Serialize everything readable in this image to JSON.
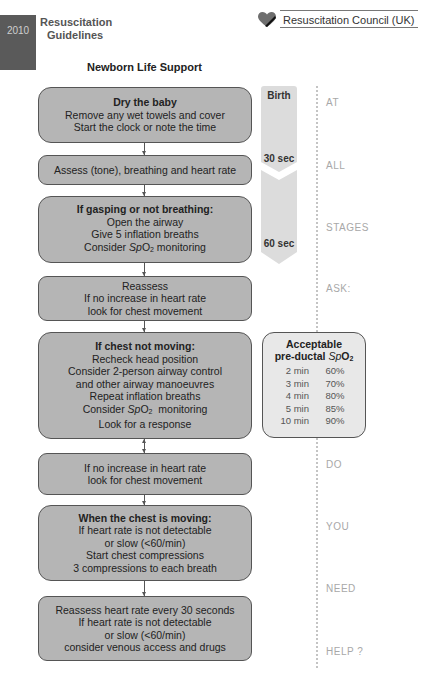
{
  "header": {
    "year": "2010",
    "guidelines_line1": "Resuscitation",
    "guidelines_line2": "Guidelines",
    "organization": "Resuscitation Council (UK)",
    "page_title": "Newborn Life Support"
  },
  "flow": [
    {
      "heading": "Dry the baby",
      "lines": [
        "Remove any wet towels and cover",
        "Start the clock or note the time"
      ]
    },
    {
      "heading": "",
      "lines": [
        "Assess (tone), breathing and heart rate"
      ]
    },
    {
      "heading": "If gasping or not breathing:",
      "lines": [
        "Open the airway",
        "Give 5 inflation breaths",
        "Consider SpO2 monitoring"
      ]
    },
    {
      "heading": "",
      "lines": [
        "Reassess",
        "If no increase in heart rate",
        "look for chest movement"
      ]
    },
    {
      "heading": "If chest not moving:",
      "lines": [
        "Recheck head position",
        "Consider 2-person airway control",
        "and other airway manoeuvres",
        "Repeat inflation breaths",
        "Consider SpO2  monitoring",
        "Look for a response"
      ]
    },
    {
      "heading": "",
      "lines": [
        "If no increase in heart rate",
        "look for chest movement"
      ]
    },
    {
      "heading": "When the chest is moving:",
      "lines": [
        "If heart rate is not detectable",
        "or slow (<60/min)",
        "Start chest compressions",
        "3 compressions to each breath"
      ]
    },
    {
      "heading": "",
      "lines": [
        "Reassess heart rate every 30 seconds",
        "If heart rate is not detectable",
        "or slow (<60/min)",
        "consider venous access and drugs"
      ]
    }
  ],
  "timeline": {
    "birth": "Birth",
    "t30": "30 sec",
    "t60": "60 sec"
  },
  "side_words": [
    "AT",
    "ALL",
    "STAGES",
    "ASK:",
    "DO",
    "YOU",
    "NEED",
    "HELP ?"
  ],
  "spo2": {
    "title_line1": "Acceptable",
    "title_line2_prefix": "pre-ductal ",
    "title_sp": "Sp",
    "title_o": "O",
    "title_sub": "2",
    "rows": [
      {
        "time": "2 min",
        "value": "60%"
      },
      {
        "time": "3 min",
        "value": "70%"
      },
      {
        "time": "4 min",
        "value": "80%"
      },
      {
        "time": "5 min",
        "value": "85%"
      },
      {
        "time": "10 min",
        "value": "90%"
      }
    ]
  },
  "colors": {
    "box_fill": "#b5b5b5",
    "box_border": "#555555",
    "timeline_fill": "#dcdcdc",
    "spo2_fill": "#e8e8e8",
    "year_block": "#5a5a5a",
    "side_word": "#a8a8a8"
  }
}
